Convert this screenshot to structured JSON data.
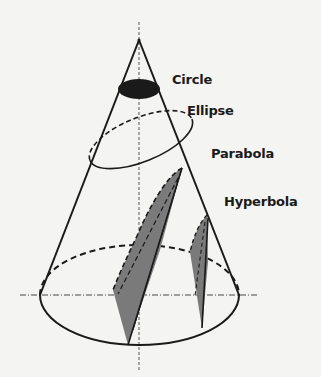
{
  "diagram": {
    "labels": {
      "circle": "Circle",
      "ellipse": "Ellipse",
      "parabola": "Parabola",
      "hyperbola": "Hyperbola"
    },
    "colors": {
      "background": "#f4f4f2",
      "line": "#1a1a1a",
      "fill_dark": "#1a1a1a",
      "fill_shade": "#7a7a7a"
    }
  }
}
